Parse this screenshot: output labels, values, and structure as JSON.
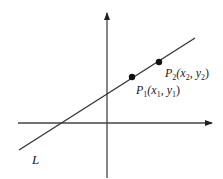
{
  "diagram": {
    "type": "line-through-two-points",
    "line_label": "L",
    "points": [
      {
        "name": "P",
        "sub": "1",
        "coords": "(x",
        "x_sub": "1",
        "sep": ", y",
        "y_sub": "1",
        "close": ")"
      },
      {
        "name": "P",
        "sub": "2",
        "coords": "(x",
        "x_sub": "2",
        "sep": ", y",
        "y_sub": "2",
        "close": ")"
      }
    ],
    "colors": {
      "stroke": "#333333",
      "point": "#111111",
      "text": "#1a1a1a"
    }
  }
}
